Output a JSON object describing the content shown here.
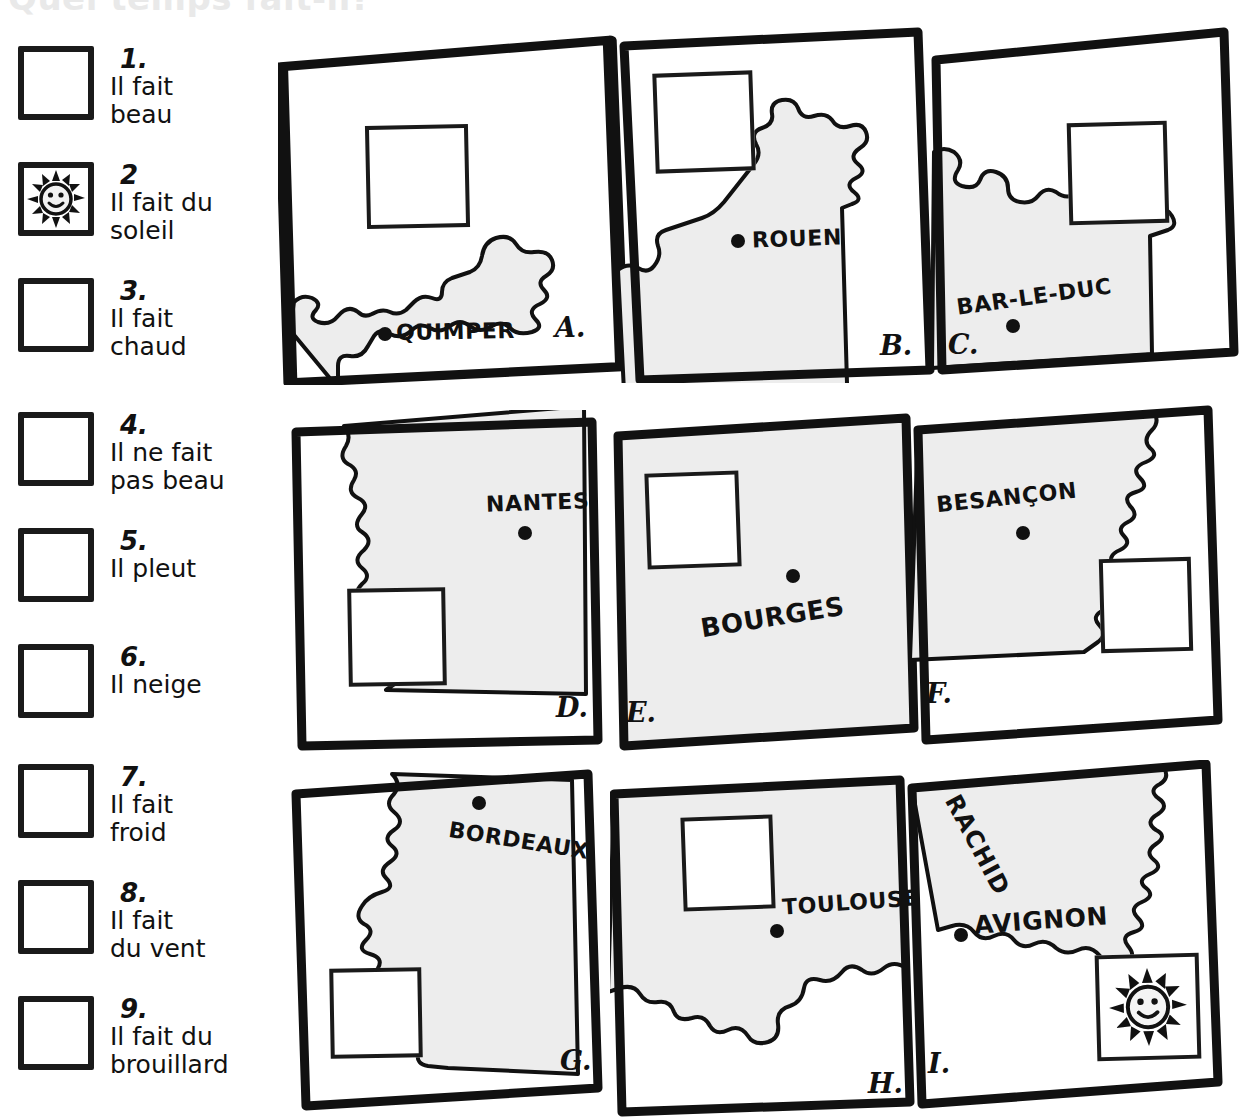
{
  "title": "Quel temps fait-il?",
  "legend": {
    "items": [
      {
        "number": "1.",
        "lines": [
          "Il fait",
          "beau"
        ],
        "icon": "none",
        "checked": false
      },
      {
        "number": "2",
        "lines": [
          "Il fait du",
          "soleil"
        ],
        "icon": "sun-icon",
        "checked": true
      },
      {
        "number": "3.",
        "lines": [
          "Il fait",
          "chaud"
        ],
        "icon": "none",
        "checked": false
      },
      {
        "number": "4.",
        "lines": [
          "Il ne fait",
          "pas beau"
        ],
        "icon": "none",
        "checked": false
      },
      {
        "number": "5.",
        "lines": [
          "Il pleut"
        ],
        "icon": "none",
        "checked": false
      },
      {
        "number": "6.",
        "lines": [
          "Il neige"
        ],
        "icon": "none",
        "checked": false
      },
      {
        "number": "7.",
        "lines": [
          "Il fait",
          "froid"
        ],
        "icon": "none",
        "checked": false
      },
      {
        "number": "8.",
        "lines": [
          "Il fait",
          "du vent"
        ],
        "icon": "none",
        "checked": false
      },
      {
        "number": "9.",
        "lines": [
          "Il fait du",
          "brouillard"
        ],
        "icon": "none",
        "checked": false
      }
    ]
  },
  "maps": {
    "panels": [
      {
        "letter": "A.",
        "city": "QUIMPER",
        "answer": "empty",
        "row": 1,
        "col": 1
      },
      {
        "letter": "B.",
        "city": "ROUEN",
        "answer": "empty",
        "row": 1,
        "col": 2
      },
      {
        "letter": "C.",
        "city": "BAR-LE-DUC",
        "answer": "empty",
        "row": 1,
        "col": 3
      },
      {
        "letter": "D.",
        "city": "NANTES",
        "answer": "empty",
        "row": 2,
        "col": 1
      },
      {
        "letter": "E.",
        "city": "BOURGES",
        "answer": "empty",
        "row": 2,
        "col": 2
      },
      {
        "letter": "F.",
        "city": "BESANÇON",
        "answer": "empty",
        "row": 2,
        "col": 3
      },
      {
        "letter": "G.",
        "city": "BORDEAUX",
        "answer": "empty",
        "row": 3,
        "col": 1
      },
      {
        "letter": "H.",
        "city": "TOULOUSE",
        "answer": "empty",
        "row": 3,
        "col": 2
      },
      {
        "letter": "I.",
        "city": "AVIGNON",
        "answer": "sun-icon",
        "row": 3,
        "col": 3,
        "student_name": "RACHID"
      }
    ]
  },
  "colors": {
    "ink": "#111111",
    "land_fill": "#ededed",
    "paper": "#ffffff",
    "title_gray": "#e9e9e9"
  }
}
